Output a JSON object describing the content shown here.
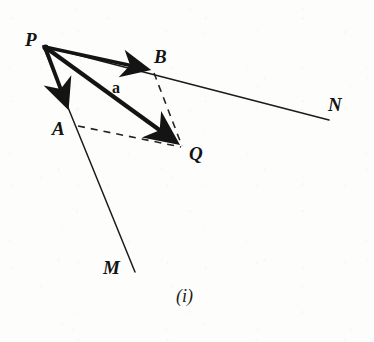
{
  "figure": {
    "caption": "(i)",
    "ink_color": "#141414",
    "paper_color": "#fdfdfc"
  },
  "points": [
    {
      "id": "P",
      "label": "P",
      "x": 43,
      "y": 46,
      "label_x": 25,
      "label_y": 30
    },
    {
      "id": "A",
      "label": "A",
      "x": 70,
      "y": 114,
      "label_x": 52,
      "label_y": 119
    },
    {
      "id": "B",
      "label": "B",
      "x": 152,
      "y": 70,
      "label_x": 154,
      "label_y": 47
    },
    {
      "id": "Q",
      "label": "Q",
      "x": 183,
      "y": 147,
      "label_x": 189,
      "label_y": 144
    },
    {
      "id": "M",
      "label": "M",
      "x": 135,
      "y": 272,
      "label_x": 103,
      "label_y": 258
    },
    {
      "id": "N",
      "label": "N",
      "x": 329,
      "y": 120,
      "label_x": 328,
      "label_y": 95
    }
  ],
  "vectors": [
    {
      "id": "PB",
      "label": "",
      "from": "P",
      "to": "B",
      "style": "bold-arrow",
      "x1": 43,
      "y1": 46,
      "x2": 152,
      "y2": 70
    },
    {
      "id": "PQ",
      "label": "a",
      "from": "P",
      "to": "Q",
      "style": "bold-arrow",
      "x1": 43,
      "y1": 46,
      "x2": 183,
      "y2": 147,
      "label_x": 112,
      "label_y": 80
    },
    {
      "id": "PA",
      "label": "",
      "from": "P",
      "to": "A",
      "style": "bold-arrow",
      "x1": 43,
      "y1": 46,
      "x2": 70,
      "y2": 114
    }
  ],
  "rays": [
    {
      "id": "PN",
      "from": "P",
      "through": "B",
      "to": "N",
      "style": "thin-line",
      "x1": 43,
      "y1": 46,
      "x2": 329,
      "y2": 120
    },
    {
      "id": "PM",
      "from": "P",
      "through": "A",
      "to": "M",
      "style": "thin-line",
      "x1": 43,
      "y1": 46,
      "x2": 135,
      "y2": 272
    }
  ],
  "construction_lines": [
    {
      "id": "BQ",
      "from": "B",
      "to": "Q",
      "style": "dashed",
      "x1": 154,
      "y1": 73,
      "x2": 182,
      "y2": 146
    },
    {
      "id": "AQ",
      "from": "A",
      "to": "Q",
      "style": "dashed",
      "x1": 78,
      "y1": 126,
      "x2": 181,
      "y2": 147
    }
  ]
}
